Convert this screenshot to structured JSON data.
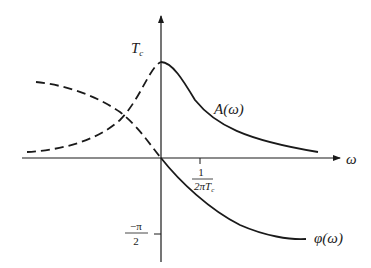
{
  "figure": {
    "colors": {
      "ink": "#1a1a1a",
      "background": "#ffffff"
    },
    "axes": {
      "x_label": "ω",
      "y_peak_label_main": "T",
      "y_peak_label_sub": "c",
      "x_tick": {
        "numerator": "1",
        "denominator_main": "2πT",
        "denominator_sub": "c"
      },
      "y_tick": {
        "numerator": "−π",
        "denominator": "2"
      }
    },
    "curves": [
      {
        "name": "amplitude",
        "label": "A(ω)",
        "style_solid_for_positive_omega": true,
        "style_dashed_for_negative_omega": true
      },
      {
        "name": "phase",
        "label": "φ(ω)",
        "style_solid_for_positive_omega": true,
        "style_dashed_for_negative_omega": true
      }
    ]
  }
}
